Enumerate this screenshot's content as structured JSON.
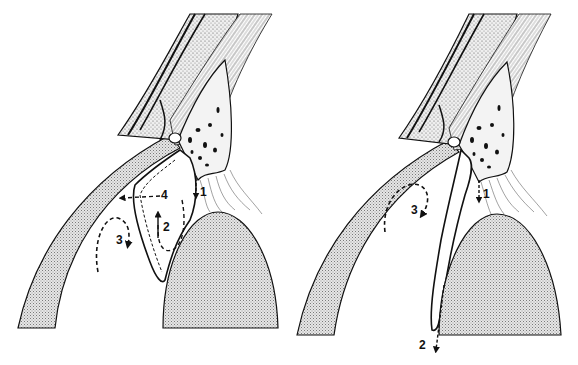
{
  "figure": {
    "colors": {
      "ink": "#111111",
      "stipple": "#c8c8c8",
      "background": "#ffffff"
    }
  },
  "panels": [
    {
      "id": "left",
      "labels": {
        "l1": "1",
        "l2": "2",
        "l3": "3",
        "l4": "4"
      }
    },
    {
      "id": "right",
      "labels": {
        "l1": "1",
        "l2": "2",
        "l3": "3"
      }
    }
  ]
}
